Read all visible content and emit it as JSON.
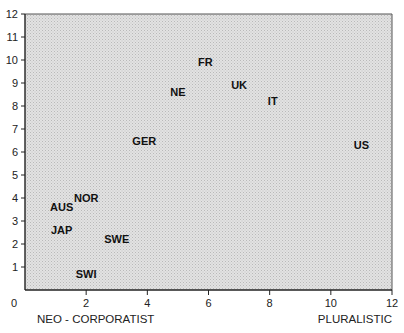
{
  "chart_data": {
    "type": "scatter",
    "title": "",
    "xlabel_left": "NEO - CORPORATIST",
    "xlabel_right": "PLURALISTIC",
    "ylabel": "",
    "xlim": [
      0,
      12
    ],
    "ylim": [
      0,
      12
    ],
    "x_ticks": [
      0,
      2,
      4,
      6,
      8,
      10,
      12
    ],
    "y_ticks": [
      1,
      2,
      3,
      4,
      5,
      6,
      7,
      8,
      9,
      10,
      11,
      12
    ],
    "grid": false,
    "legend": null,
    "marker": "text-label",
    "points": [
      {
        "label": "FR",
        "x": 5.9,
        "y": 9.9
      },
      {
        "label": "UK",
        "x": 7.0,
        "y": 8.9
      },
      {
        "label": "NE",
        "x": 5.0,
        "y": 8.6
      },
      {
        "label": "IT",
        "x": 8.1,
        "y": 8.2
      },
      {
        "label": "GER",
        "x": 3.9,
        "y": 6.5
      },
      {
        "label": "US",
        "x": 11.0,
        "y": 6.3
      },
      {
        "label": "NOR",
        "x": 2.0,
        "y": 4.0
      },
      {
        "label": "AUS",
        "x": 1.2,
        "y": 3.6
      },
      {
        "label": "JAP",
        "x": 1.2,
        "y": 2.6
      },
      {
        "label": "SWE",
        "x": 3.0,
        "y": 2.2
      },
      {
        "label": "SWI",
        "x": 2.0,
        "y": 0.7
      }
    ]
  },
  "colors": {
    "plot_background": "#d9d9d9",
    "text": "#111111",
    "axis": "#222222"
  }
}
